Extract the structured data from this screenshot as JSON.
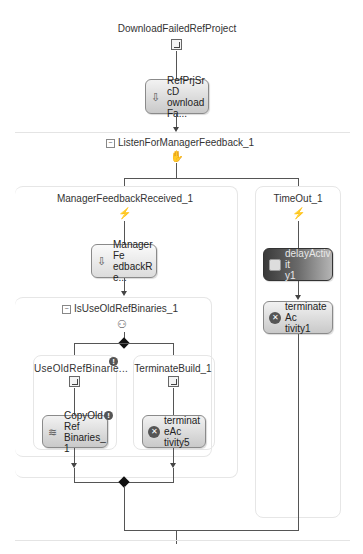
{
  "workflow": {
    "root": {
      "label": "DownloadFailedRefProject",
      "icon": "sequence-icon",
      "activity": {
        "label": "RefPrjSrcDownloadFa...",
        "line1": "RefPrjSrcD",
        "line2": "ownloadFa...",
        "icon": "download-activity-icon"
      }
    },
    "listen": {
      "label": "ListenForManagerFeedback_1",
      "collapse_glyph": "−",
      "icon": "listen-icon",
      "branches": [
        {
          "label": "ManagerFeedbackReceived_1",
          "icon": "event-driven-icon",
          "activity": {
            "line1": "ManagerFe",
            "line2": "edbackRe...",
            "icon": "handle-external-event-icon"
          },
          "ifelse": {
            "label": "IsUseOldRefBinaries_1",
            "collapse_glyph": "−",
            "icon": "ifelse-icon",
            "branches": [
              {
                "label": "UseOldRefBinarie...",
                "icon": "sequence-icon",
                "warning": "!",
                "activity": {
                  "line1": "CopyOldRef",
                  "line2": "Binaries_1",
                  "icon": "code-activity-icon",
                  "warning": "!"
                }
              },
              {
                "label": "TerminateBuild_1",
                "icon": "sequence-icon",
                "activity": {
                  "line1": "terminateAc",
                  "line2": "tivity5",
                  "icon": "terminate-icon",
                  "glyph": "✕"
                }
              }
            ]
          }
        },
        {
          "label": "TimeOut_1",
          "icon": "event-driven-icon",
          "activities": [
            {
              "line1": "delayActivit",
              "line2": "y1",
              "icon": "delay-icon"
            },
            {
              "line1": "terminateAc",
              "line2": "tivity1",
              "icon": "terminate-icon",
              "glyph": "✕"
            }
          ]
        }
      ]
    }
  }
}
